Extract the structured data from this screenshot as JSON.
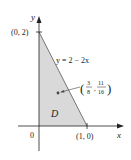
{
  "figure": {
    "axes": {
      "x_label": "x",
      "y_label": "y",
      "origin_label": "0"
    },
    "vertices": {
      "top": "(0, 2)",
      "right": "(1, 0)"
    },
    "line_equation": "y = 2 − 2x",
    "region_label": "D",
    "centroid": {
      "open": "(",
      "x_num": "3",
      "x_den": "8",
      "sep": ",",
      "y_num": "11",
      "y_den": "16",
      "close": ")"
    },
    "colors": {
      "region_fill": "#d9d9d9",
      "axis": "#222222"
    }
  }
}
